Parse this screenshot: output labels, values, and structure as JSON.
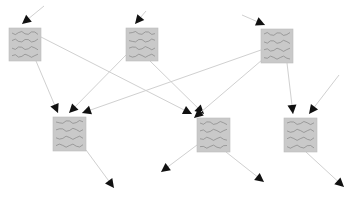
{
  "diagram": {
    "node_fill": "#c9c9c9",
    "node_stroke": "#bdbdbd",
    "squiggle_color": "#7a7a7a",
    "edge_color": "#d0d0d0",
    "arrow_color": "#111111",
    "nodes": [
      {
        "id": "n1",
        "x": 9,
        "y": 28,
        "w": 32,
        "h": 33
      },
      {
        "id": "n2",
        "x": 126,
        "y": 28,
        "w": 32,
        "h": 33
      },
      {
        "id": "n3",
        "x": 261,
        "y": 29,
        "w": 32,
        "h": 34
      },
      {
        "id": "n4",
        "x": 53,
        "y": 117,
        "w": 33,
        "h": 34
      },
      {
        "id": "n5",
        "x": 197,
        "y": 118,
        "w": 33,
        "h": 34
      },
      {
        "id": "n6",
        "x": 284,
        "y": 118,
        "w": 33,
        "h": 34
      }
    ],
    "edges": [
      {
        "x1": 44,
        "y1": 6,
        "x2": 22,
        "y2": 24
      },
      {
        "x1": 146,
        "y1": 11,
        "x2": 135,
        "y2": 24
      },
      {
        "x1": 242,
        "y1": 15,
        "x2": 265,
        "y2": 25
      },
      {
        "x1": 36,
        "y1": 61,
        "x2": 58,
        "y2": 113
      },
      {
        "x1": 126,
        "y1": 55,
        "x2": 69,
        "y2": 113
      },
      {
        "x1": 261,
        "y1": 50,
        "x2": 82,
        "y2": 113
      },
      {
        "x1": 41,
        "y1": 37,
        "x2": 192,
        "y2": 114
      },
      {
        "x1": 150,
        "y1": 61,
        "x2": 204,
        "y2": 114
      },
      {
        "x1": 262,
        "y1": 60,
        "x2": 194,
        "y2": 118
      },
      {
        "x1": 287,
        "y1": 63,
        "x2": 293,
        "y2": 114
      },
      {
        "x1": 339,
        "y1": 75,
        "x2": 309,
        "y2": 114
      },
      {
        "x1": 86,
        "y1": 150,
        "x2": 114,
        "y2": 188
      },
      {
        "x1": 197,
        "y1": 145,
        "x2": 161,
        "y2": 172
      },
      {
        "x1": 226,
        "y1": 152,
        "x2": 264,
        "y2": 182
      },
      {
        "x1": 306,
        "y1": 152,
        "x2": 344,
        "y2": 187
      }
    ]
  }
}
